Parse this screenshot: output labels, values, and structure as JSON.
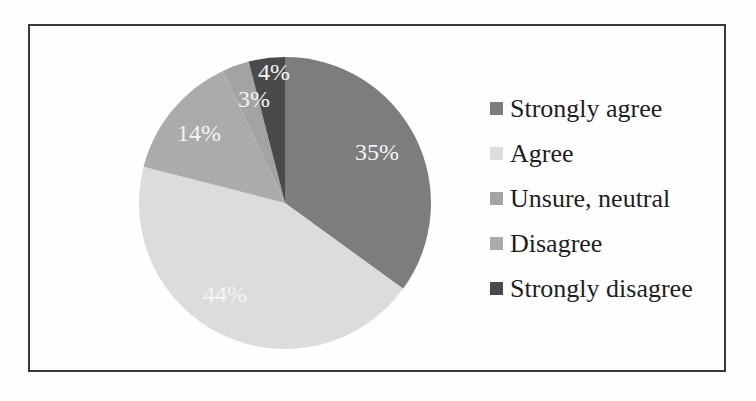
{
  "chart_data": {
    "type": "pie",
    "title": "",
    "categories": [
      "Strongly agree",
      "Agree",
      "Unsure, neutral",
      "Disagree",
      "Strongly disagree"
    ],
    "values": [
      35,
      44,
      3,
      14,
      4
    ],
    "unit": "%",
    "colors": [
      "#7d7d7d",
      "#dcdcdc",
      "#a3a3a3",
      "#ababab",
      "#4a4a4a"
    ],
    "draw_order_clockwise_from_top": [
      "Strongly agree",
      "Agree",
      "Disagree",
      "Unsure, neutral",
      "Strongly disagree"
    ],
    "data_labels": [
      "35%",
      "44%",
      "3%",
      "14%",
      "4%"
    ],
    "legend_position": "right"
  },
  "legend": {
    "items": [
      {
        "label": "Strongly agree",
        "color": "#7d7d7d"
      },
      {
        "label": "Agree",
        "color": "#dcdcdc"
      },
      {
        "label": "Unsure, neutral",
        "color": "#a3a3a3"
      },
      {
        "label": "Disagree",
        "color": "#ababab"
      },
      {
        "label": "Strongly disagree",
        "color": "#4a4a4a"
      }
    ]
  },
  "labels": {
    "strongly_agree": "35%",
    "agree": "44%",
    "unsure": "3%",
    "disagree": "14%",
    "strongly_disagree": "4%"
  }
}
